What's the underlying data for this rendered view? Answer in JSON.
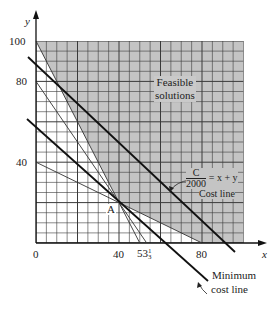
{
  "chart_data": {
    "type": "line",
    "title": "",
    "xlabel": "x",
    "ylabel": "y",
    "xlim": [
      0,
      100
    ],
    "ylim": [
      0,
      100
    ],
    "grid": true,
    "grid_step": 5,
    "x_ticks": [
      "0",
      "40",
      "53 1/3",
      "80"
    ],
    "y_ticks": [
      "40",
      "80",
      "100"
    ],
    "feasible_region": {
      "label": "Feasible solutions",
      "vertices": [
        [
          0,
          100
        ],
        [
          40,
          20
        ],
        [
          80,
          0
        ],
        [
          100,
          0
        ],
        [
          100,
          100
        ]
      ]
    },
    "constraint_lines": [
      {
        "equation": "2x + y = 100",
        "points": [
          [
            0,
            100
          ],
          [
            50,
            0
          ]
        ]
      },
      {
        "equation": "3x + 2y = 160",
        "points": [
          [
            0,
            80
          ],
          [
            53.33,
            0
          ]
        ]
      },
      {
        "equation": "x + 2y = 80",
        "points": [
          [
            0,
            40
          ],
          [
            80,
            0
          ]
        ]
      }
    ],
    "cost_lines": [
      {
        "label": "C/2000 = x + y  Cost line",
        "type": "bold"
      },
      {
        "label": "Minimum cost line",
        "equation": "x + y = 60",
        "through": [
          40,
          20
        ],
        "type": "bold"
      }
    ],
    "points": [
      {
        "label": "A",
        "x": 40,
        "y": 20
      }
    ]
  },
  "labels": {
    "y_axis": "y",
    "x_axis": "x",
    "tick_100": "100",
    "tick_80y": "80",
    "tick_40y": "40",
    "tick_0": "0",
    "tick_40x": "40",
    "tick_53_whole": "53",
    "tick_53_num": "1",
    "tick_53_den": "3",
    "tick_80x": "80",
    "feasible_line1": "Feasible",
    "feasible_line2": "solutions",
    "point_a": "A",
    "cost_num": "C",
    "cost_den": "2000",
    "cost_eq": "= x + y",
    "cost_line": "Cost line",
    "min_cost_1": "Minimum",
    "min_cost_2": "cost line"
  },
  "colors": {
    "shade": "#c4c4c4",
    "grid": "#3a3a3a",
    "line": "#1a1a1a"
  }
}
